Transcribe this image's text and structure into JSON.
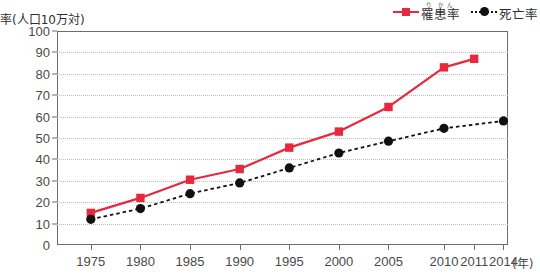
{
  "chart_data": {
    "type": "line",
    "title": "",
    "xlabel": "年",
    "ylabel": "率(人口10万対)",
    "ylim": [
      0,
      100
    ],
    "ytick_step": 10,
    "yticks": [
      0,
      10,
      20,
      30,
      40,
      50,
      60,
      70,
      80,
      90,
      100
    ],
    "categories": [
      "1975",
      "1980",
      "1985",
      "1990",
      "1995",
      "2000",
      "2005",
      "2010",
      "2011",
      "2014"
    ],
    "grid": "horizontal-dotted",
    "legend_position": "top-right",
    "series": [
      {
        "name": "罹患率",
        "ruby": "り かん",
        "color": "#e8283c",
        "marker": "square",
        "linestyle": "solid",
        "values": [
          15,
          22,
          30.5,
          35.5,
          45.5,
          53,
          64.5,
          83,
          87,
          null
        ]
      },
      {
        "name": "死亡率",
        "ruby": "",
        "color": "#111111",
        "marker": "circle",
        "linestyle": "dotted",
        "values": [
          12,
          17,
          24,
          29,
          36,
          43,
          48.5,
          54.5,
          null,
          58
        ]
      }
    ]
  },
  "legend": {
    "entries": [
      {
        "label": "罹患率",
        "ruby": "り かん"
      },
      {
        "label": "死亡率",
        "ruby": ""
      }
    ]
  },
  "axes": {
    "y_title": "率(人口10万対)",
    "x_unit": "(年)"
  }
}
